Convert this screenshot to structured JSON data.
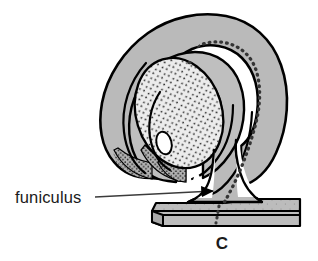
{
  "figure": {
    "panel_letter": "C",
    "annotations": [
      {
        "id": "funiculus",
        "label": "funiculus",
        "label_x": 15,
        "label_y": 202,
        "leader_start_x": 95,
        "leader_start_y": 197,
        "leader_end_x": 213,
        "leader_end_y": 191,
        "arrow": "right-pointing-solid-triangle"
      }
    ],
    "colors": {
      "body_fill": "#b9b9b9",
      "outline": "#000000",
      "stipple_light_fill": "#e8e8e8",
      "stipple_dot": "#2b2b2b",
      "background": "#ffffff",
      "text": "#1b1b1b",
      "base_plate_fill": "#bcbcbc",
      "void_fill": "#ffffff"
    },
    "structures": [
      {
        "name": "outer-integument-lobe",
        "kind": "gray-filled-curved-hook"
      },
      {
        "name": "inner-integument-lobe",
        "kind": "gray-filled-curved-hook"
      },
      {
        "name": "nucellus",
        "kind": "stippled-oval"
      },
      {
        "name": "embryo-sac",
        "kind": "small-white-oval"
      },
      {
        "name": "chalaza-stipple",
        "kind": "dense-stipple-patch"
      },
      {
        "name": "vascular-dotted-trace",
        "kind": "dotted-arc"
      },
      {
        "name": "funiculus-stalk",
        "kind": "gray-filled-flared-column"
      },
      {
        "name": "placenta-base-plate",
        "kind": "gray-filled-slab-3d"
      }
    ],
    "caption_note": "Anatropous ovule attached by funiculus to placenta"
  }
}
